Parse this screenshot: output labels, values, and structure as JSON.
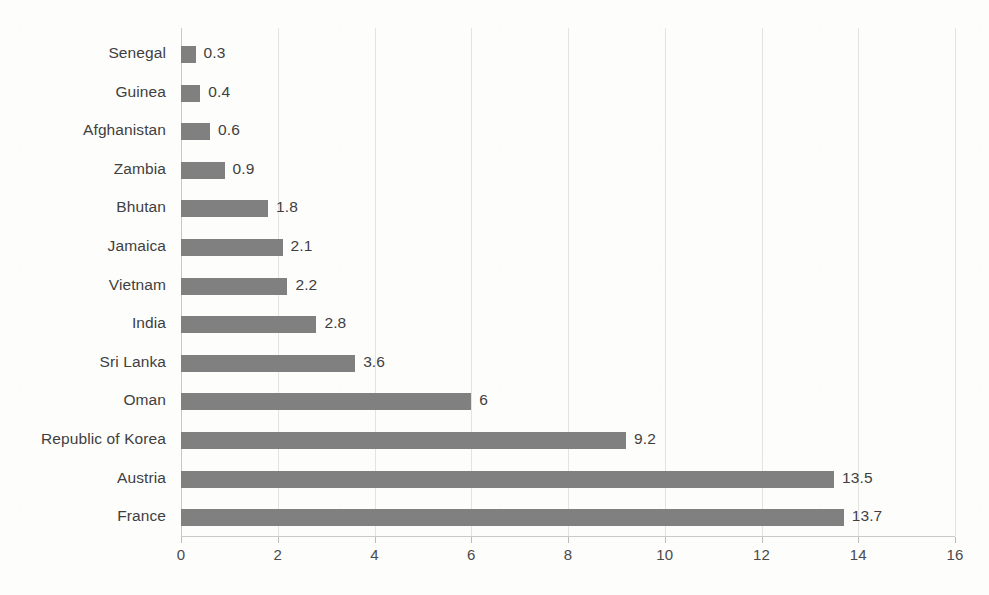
{
  "chart_data": {
    "type": "bar",
    "orientation": "horizontal",
    "title": "",
    "subtitle": "",
    "xlabel": "",
    "ylabel": "",
    "xlim": [
      0,
      16
    ],
    "xticks": [
      "0",
      "2",
      "4",
      "6",
      "8",
      "10",
      "12",
      "14",
      "16"
    ],
    "grid": true,
    "legend": "none",
    "data_labels_shown": true,
    "bar_color": "#808080",
    "categories": [
      "Senegal",
      "Guinea",
      "Afghanistan",
      "Zambia",
      "Bhutan",
      "Jamaica",
      "Vietnam",
      "India",
      "Sri Lanka",
      "Oman",
      "Republic of Korea",
      "Austria",
      "France"
    ],
    "values": [
      0.3,
      0.4,
      0.6,
      0.9,
      1.8,
      2.1,
      2.2,
      2.8,
      3.6,
      6,
      9.2,
      13.5,
      13.7
    ],
    "value_labels": [
      "0.3",
      "0.4",
      "0.6",
      "0.9",
      "1.8",
      "2.1",
      "2.2",
      "2.8",
      "3.6",
      "6",
      "9.2",
      "13.5",
      "13.7"
    ]
  }
}
